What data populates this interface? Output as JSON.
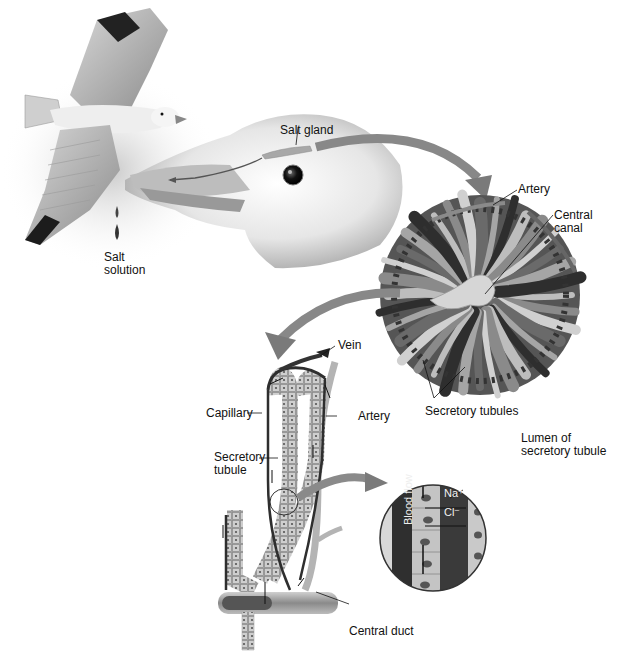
{
  "figure": {
    "palette": {
      "background": "#ffffff",
      "bird_light": "#e4e4e4",
      "bird_mid": "#b0b0b0",
      "bird_dark": "#3a3a3a",
      "arrow": "#7a7a7a",
      "tubule_light": "#c8c8c8",
      "tubule_dark": "#4a4a4a",
      "vessel": "#a8a8a8",
      "capillary": "#2e2e2e",
      "lumen": "#3c3c3c",
      "text": "#111111"
    }
  },
  "labels": {
    "salt_gland": "Salt gland",
    "salt_solution": "Salt\nsolution",
    "artery_top": "Artery",
    "central_canal": "Central\ncanal",
    "secretory_tubules": "Secretory tubules",
    "vein": "Vein",
    "capillary": "Capillary",
    "artery_bottom": "Artery",
    "secretory_tubule": "Secretory\ntubule",
    "lumen": "Lumen of\nsecretory tubule",
    "blood_flow": "Blood flow",
    "na": "Na⁺",
    "cl": "Cl⁻",
    "central_duct": "Central duct"
  }
}
